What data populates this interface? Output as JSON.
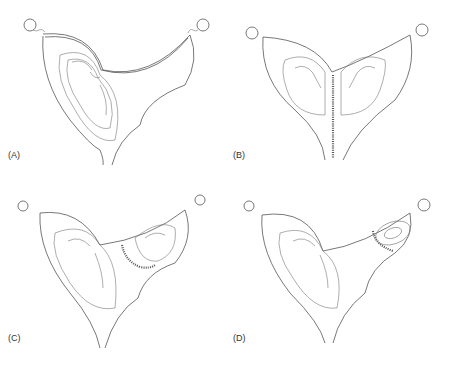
{
  "figure": {
    "panels": [
      {
        "id": "A",
        "label": "(A)",
        "description": "Bicornuate uterus, single pregnancy in left horn"
      },
      {
        "id": "B",
        "label": "(B)",
        "description": "Septate uterus, twin pregnancy one fetus in each cavity"
      },
      {
        "id": "C",
        "label": "(C)",
        "description": "Bicornuate uterus, pregnancy in both horns with partial septum"
      },
      {
        "id": "D",
        "label": "(D)",
        "description": "Bicornuate uterus, pregnancy in left horn with early gestation in right horn"
      }
    ]
  },
  "colors": {
    "line": "#555555",
    "background": "#ffffff",
    "label": "#333333"
  }
}
